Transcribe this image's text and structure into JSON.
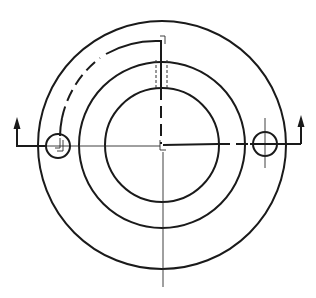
{
  "diagram": {
    "type": "technical-drawing",
    "colors": {
      "line": "#1a1a1a",
      "background": "#ffffff"
    },
    "center": {
      "x": 162,
      "y": 145
    },
    "circles": {
      "outer_radius": 124,
      "middle_radius": 83,
      "inner_radius": 57,
      "hole_radius": 12
    },
    "holes": [
      {
        "name": "left-bolt-hole",
        "x": 58,
        "y": 146
      },
      {
        "name": "right-bolt-hole",
        "x": 265,
        "y": 144
      }
    ],
    "cutting_plane": {
      "left_arrow": {
        "x": 17,
        "y_top": 120,
        "direction": "up"
      },
      "right_arrow": {
        "x": 301,
        "y_top": 115,
        "direction": "up"
      }
    }
  }
}
